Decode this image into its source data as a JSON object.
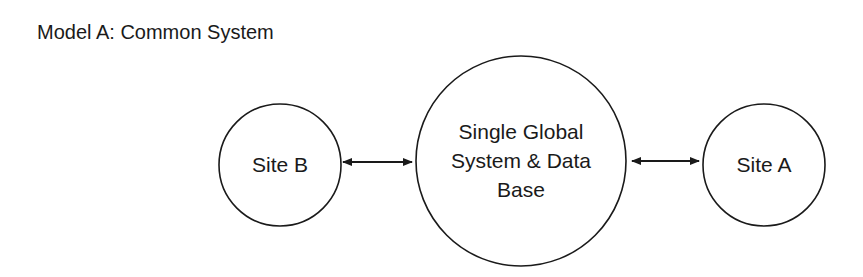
{
  "title": "Model A: Common System",
  "colors": {
    "stroke": "#1a1a1a",
    "background": "#ffffff",
    "text": "#1a1a1a"
  },
  "nodes": [
    {
      "id": "site-b",
      "lines": [
        "Site B"
      ]
    },
    {
      "id": "global",
      "lines": [
        "Single Global",
        "System & Data",
        "Base"
      ]
    },
    {
      "id": "site-a",
      "lines": [
        "Site A"
      ]
    }
  ],
  "edges": [
    {
      "from": "site-b",
      "to": "global",
      "type": "bidirectional"
    },
    {
      "from": "global",
      "to": "site-a",
      "type": "bidirectional"
    }
  ]
}
